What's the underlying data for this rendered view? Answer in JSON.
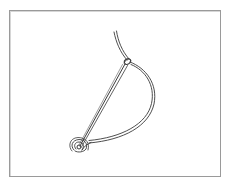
{
  "figure": {
    "caption": "",
    "colors": {
      "background": "#ffffff",
      "frame": "#9a9a9a",
      "line": "#3a3a3a"
    }
  }
}
